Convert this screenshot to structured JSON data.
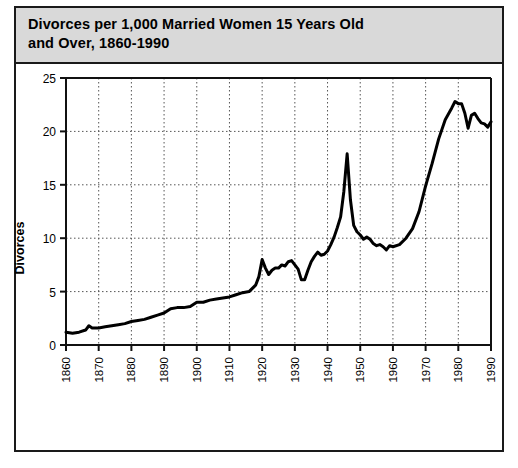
{
  "figure": {
    "title": "Divorces per 1,000 Married Women 15 Years Old\nand Over, 1860-1990",
    "frame_color": "#1a1a1a",
    "title_bar_color": "#d9d9d9"
  },
  "chart_data": {
    "type": "line",
    "title": "Divorces per 1,000 Married Women 15 Years Old and Over, 1860-1990",
    "xlabel": "Year",
    "ylabel": "Divorces",
    "xlim": [
      1860,
      1990
    ],
    "ylim": [
      0,
      25
    ],
    "xticks": [
      1860,
      1870,
      1880,
      1890,
      1900,
      1910,
      1920,
      1930,
      1940,
      1950,
      1960,
      1970,
      1980,
      1990
    ],
    "xtick_labels": [
      "1860",
      "1870",
      "1880",
      "1890",
      "1900",
      "1910",
      "1920",
      "1930",
      "1940",
      "1950",
      "1960",
      "1970",
      "1980",
      "1990"
    ],
    "yticks": [
      0,
      5,
      10,
      15,
      20,
      25
    ],
    "ytick_labels": [
      "0",
      "5",
      "10",
      "15",
      "20",
      "25"
    ],
    "grid": "both-dotted",
    "legend": "none",
    "line_color": "#000000",
    "line_width": 3,
    "series": [
      {
        "name": "Divorces per 1,000 married women 15+",
        "x": [
          1860,
          1862,
          1864,
          1866,
          1867,
          1868,
          1870,
          1872,
          1874,
          1876,
          1878,
          1880,
          1882,
          1884,
          1886,
          1888,
          1890,
          1892,
          1894,
          1896,
          1898,
          1900,
          1902,
          1904,
          1906,
          1908,
          1910,
          1912,
          1914,
          1916,
          1918,
          1919,
          1920,
          1921,
          1922,
          1923,
          1924,
          1925,
          1926,
          1927,
          1928,
          1929,
          1930,
          1931,
          1932,
          1933,
          1934,
          1935,
          1936,
          1937,
          1938,
          1939,
          1940,
          1941,
          1942,
          1943,
          1944,
          1945,
          1946,
          1947,
          1948,
          1949,
          1950,
          1951,
          1952,
          1953,
          1954,
          1955,
          1956,
          1957,
          1958,
          1959,
          1960,
          1962,
          1964,
          1966,
          1968,
          1970,
          1972,
          1974,
          1976,
          1978,
          1979,
          1980,
          1981,
          1982,
          1983,
          1984,
          1985,
          1986,
          1987,
          1988,
          1989,
          1990
        ],
        "y": [
          1.2,
          1.1,
          1.2,
          1.4,
          1.8,
          1.6,
          1.6,
          1.7,
          1.8,
          1.9,
          2.0,
          2.2,
          2.3,
          2.4,
          2.6,
          2.8,
          3.0,
          3.4,
          3.5,
          3.5,
          3.6,
          4.0,
          4.0,
          4.2,
          4.3,
          4.4,
          4.5,
          4.7,
          4.9,
          5.0,
          5.6,
          6.4,
          8.0,
          7.2,
          6.6,
          7.0,
          7.2,
          7.2,
          7.5,
          7.4,
          7.8,
          7.9,
          7.5,
          7.1,
          6.1,
          6.1,
          7.0,
          7.8,
          8.3,
          8.7,
          8.4,
          8.5,
          8.8,
          9.4,
          10.1,
          11.0,
          12.0,
          14.4,
          17.9,
          13.6,
          11.2,
          10.6,
          10.3,
          9.9,
          10.1,
          9.9,
          9.5,
          9.3,
          9.4,
          9.2,
          8.9,
          9.3,
          9.2,
          9.4,
          10.0,
          10.9,
          12.5,
          14.9,
          17.0,
          19.3,
          21.1,
          22.2,
          22.8,
          22.6,
          22.6,
          21.7,
          20.3,
          21.5,
          21.7,
          21.2,
          20.8,
          20.7,
          20.4,
          20.9
        ]
      }
    ]
  },
  "axis": {
    "y_title": "Divorces",
    "x_title": "Year"
  }
}
